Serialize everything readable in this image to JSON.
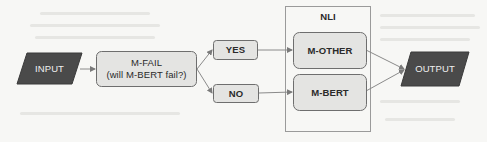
{
  "diagram": {
    "type": "flowchart",
    "nodes": [
      {
        "id": "input",
        "label": "INPUT",
        "shape": "parallelogram",
        "style": "dark"
      },
      {
        "id": "mfail",
        "label_line1": "M-FAIL",
        "label_line2": "(will M-BERT fail?)",
        "shape": "rounded-rect",
        "style": "light"
      },
      {
        "id": "yes",
        "label": "YES",
        "shape": "rounded-rect",
        "style": "light"
      },
      {
        "id": "no",
        "label": "NO",
        "shape": "rounded-rect",
        "style": "light"
      },
      {
        "id": "mother",
        "label": "M-OTHER",
        "shape": "rounded-rect",
        "style": "light"
      },
      {
        "id": "mbert",
        "label": "M-BERT",
        "shape": "rounded-rect",
        "style": "light"
      },
      {
        "id": "output",
        "label": "OUTPUT",
        "shape": "parallelogram",
        "style": "dark"
      }
    ],
    "group": {
      "id": "nli",
      "label": "NLI",
      "contains": [
        "mother",
        "mbert"
      ]
    },
    "edges": [
      {
        "from": "input",
        "to": "mfail"
      },
      {
        "from": "mfail",
        "to": "yes"
      },
      {
        "from": "mfail",
        "to": "no"
      },
      {
        "from": "yes",
        "to": "mother"
      },
      {
        "from": "no",
        "to": "mbert"
      },
      {
        "from": "mother",
        "to": "output"
      },
      {
        "from": "mbert",
        "to": "output"
      }
    ]
  },
  "colors": {
    "dark_fill": "#4a4a4a",
    "light_fill": "#e4e4e2",
    "stroke": "#6e6e6e",
    "edge": "#8a8a8a",
    "group_border": "#9a9a9a",
    "background": "#f7f7f5"
  }
}
